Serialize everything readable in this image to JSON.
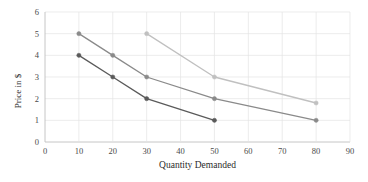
{
  "chart_data": {
    "type": "line",
    "title": "",
    "xlabel": "Quantity Demanded",
    "ylabel": "Price in $",
    "xlim": [
      0,
      90
    ],
    "ylim": [
      0,
      6
    ],
    "xticks": [
      0,
      10,
      20,
      30,
      40,
      50,
      60,
      70,
      80,
      90
    ],
    "yticks": [
      0,
      1,
      2,
      3,
      4,
      5,
      6
    ],
    "grid": true,
    "legend": "none",
    "background": "#ffffff",
    "gridline_color": "#e4e4e4",
    "axis_color": "#bfbfbf",
    "tick_label_color": "#4a4a4a",
    "series": [
      {
        "name": "Demand curve 1",
        "color": "#5a5a5a",
        "marker": "circle",
        "points": [
          {
            "x": 10,
            "y": 4
          },
          {
            "x": 20,
            "y": 3
          },
          {
            "x": 30,
            "y": 2
          },
          {
            "x": 50,
            "y": 1
          }
        ]
      },
      {
        "name": "Demand curve 2",
        "color": "#8a8a8a",
        "marker": "circle",
        "points": [
          {
            "x": 10,
            "y": 5
          },
          {
            "x": 20,
            "y": 4
          },
          {
            "x": 30,
            "y": 3
          },
          {
            "x": 50,
            "y": 2
          },
          {
            "x": 80,
            "y": 1
          }
        ]
      },
      {
        "name": "Demand curve 3",
        "color": "#c0c0c0",
        "marker": "circle",
        "points": [
          {
            "x": 30,
            "y": 5
          },
          {
            "x": 50,
            "y": 3
          },
          {
            "x": 80,
            "y": 1.8
          }
        ]
      }
    ]
  }
}
